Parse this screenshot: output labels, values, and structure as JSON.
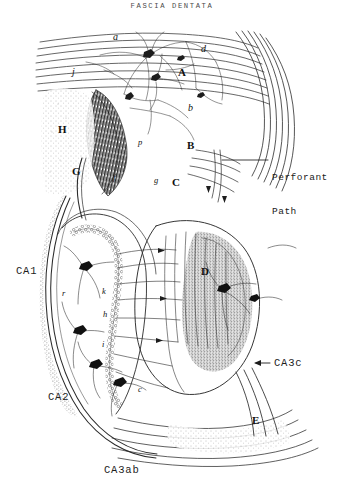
{
  "figure": {
    "title": "FASCIA DENTATA",
    "background_color": "#ffffff",
    "ink_color": "#2b2b2b",
    "width": 344,
    "height": 490
  },
  "callouts": [
    {
      "id": "perforant-path",
      "line1": "Perforant",
      "line2": "Path",
      "x": 272,
      "y": 150
    }
  ],
  "region_labels": [
    {
      "id": "ca1",
      "text": "CA1",
      "x": 16,
      "y": 265
    },
    {
      "id": "ca2",
      "text": "CA2",
      "x": 48,
      "y": 391
    },
    {
      "id": "ca3ab",
      "text": "CA3ab",
      "x": 104,
      "y": 464
    },
    {
      "id": "ca3c",
      "text": "CA3c",
      "x": 274,
      "y": 357
    }
  ],
  "arrow_markers": [
    {
      "id": "ca3c-arrow",
      "direction": "left",
      "x": 258,
      "y": 362
    }
  ],
  "anatomical_labels": [
    {
      "id": "label-a",
      "text": "a",
      "x": 113,
      "y": 31,
      "style": "italic"
    },
    {
      "id": "label-d",
      "text": "d",
      "x": 201,
      "y": 43,
      "style": "italic"
    },
    {
      "id": "label-A-cap",
      "text": "A",
      "x": 178,
      "y": 66,
      "style": "cap"
    },
    {
      "id": "label-b",
      "text": "b",
      "x": 188,
      "y": 102,
      "style": "italic"
    },
    {
      "id": "label-j",
      "text": "j",
      "x": 72,
      "y": 66,
      "style": "italic"
    },
    {
      "id": "label-H-cap",
      "text": "H",
      "x": 58,
      "y": 123,
      "style": "cap"
    },
    {
      "id": "label-G-cap",
      "text": "G",
      "x": 72,
      "y": 165,
      "style": "cap"
    },
    {
      "id": "label-f",
      "text": "f",
      "x": 113,
      "y": 172,
      "style": "italic"
    },
    {
      "id": "label-p",
      "text": "p",
      "x": 138,
      "y": 137,
      "style": "italic"
    },
    {
      "id": "label-B-cap",
      "text": "B",
      "x": 187,
      "y": 139,
      "style": "cap"
    },
    {
      "id": "label-g",
      "text": "g",
      "x": 154,
      "y": 175,
      "style": "italic"
    },
    {
      "id": "label-C-cap",
      "text": "C",
      "x": 172,
      "y": 176,
      "style": "cap"
    },
    {
      "id": "label-r",
      "text": "r",
      "x": 62,
      "y": 288,
      "style": "italic"
    },
    {
      "id": "label-k",
      "text": "k",
      "x": 102,
      "y": 286,
      "style": "italic"
    },
    {
      "id": "label-h",
      "text": "h",
      "x": 103,
      "y": 309,
      "style": "italic"
    },
    {
      "id": "label-i",
      "text": "i",
      "x": 102,
      "y": 339,
      "style": "italic"
    },
    {
      "id": "label-D-cap",
      "text": "D",
      "x": 201,
      "y": 265,
      "style": "cap"
    },
    {
      "id": "label-c",
      "text": "c",
      "x": 138,
      "y": 384,
      "style": "italic"
    },
    {
      "id": "label-E-cap",
      "text": "E",
      "x": 252,
      "y": 414,
      "style": "cap"
    }
  ]
}
